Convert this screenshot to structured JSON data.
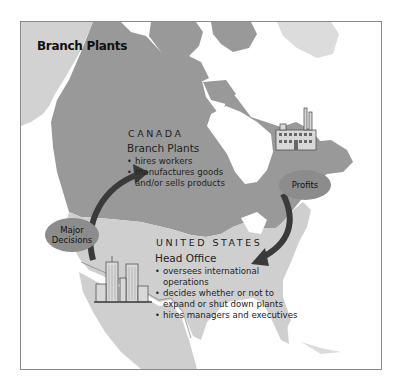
{
  "title": "Branch Plants",
  "canada": {
    "country_label": "CANADA",
    "heading": "Branch Plants",
    "bullets": [
      "hires workers",
      "manufactures goods and/or sells products"
    ],
    "icon": "factory-icon"
  },
  "united_states": {
    "country_label": "UNITED STATES",
    "heading": "Head Office",
    "bullets": [
      "oversees international operations",
      "decides whether or not to expand or shut down plants",
      "hires managers and executives"
    ],
    "icon": "skyscrapers-icon"
  },
  "flows": [
    {
      "label": "Major Decisions",
      "from": "United States",
      "to": "Canada"
    },
    {
      "label": "Profits",
      "from": "Canada",
      "to": "United States"
    }
  ],
  "colors": {
    "canada_fill": "#999999",
    "us_fill": "#cfcfcf",
    "greenland_fill": "#dadada",
    "bubble_fill": "#8c8c8c",
    "arrow": "#3a3a3a",
    "frame": "#8a8a8a"
  }
}
